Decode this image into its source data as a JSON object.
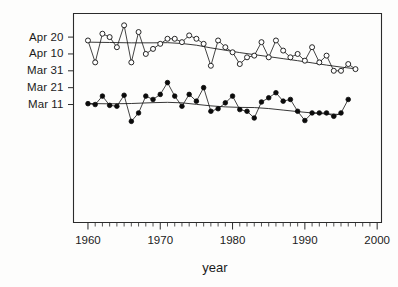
{
  "chart_data": {
    "type": "line",
    "title": "",
    "xlabel": "year",
    "ylabel": "",
    "xlim": [
      1958.0,
      2000.6
    ],
    "ylim": [
      0,
      124
    ],
    "grid": false,
    "legend_position": "none",
    "x_ticks_major": [
      1960,
      1970,
      1980,
      1990,
      2000
    ],
    "x_tick_labels": [
      "1960",
      "1970",
      "1980",
      "1990",
      "2000"
    ],
    "x_ticks_minor_step": 1,
    "y_ticks": [
      110,
      100,
      90,
      80,
      70
    ],
    "y_tick_labels": [
      "Apr 20",
      "Apr 10",
      "Mar 31",
      "Mar 21",
      "Mar 11"
    ],
    "y_axis_note": "day-of-year style calendar dates, 10-day intervals",
    "series": [
      {
        "name": "open-circles-series",
        "marker": "open-circle",
        "x": [
          1960,
          1961,
          1962,
          1963,
          1964,
          1965,
          1966,
          1967,
          1968,
          1969,
          1970,
          1971,
          1972,
          1973,
          1974,
          1975,
          1976,
          1977,
          1978,
          1979,
          1980,
          1981,
          1982,
          1983,
          1984,
          1985,
          1986,
          1987,
          1988,
          1989,
          1990,
          1991,
          1992,
          1993,
          1994,
          1995,
          1996,
          1997
        ],
        "values": [
          108,
          95,
          112,
          110,
          104,
          117,
          95,
          113,
          100,
          103,
          106,
          109,
          109,
          107,
          111,
          109,
          106,
          93,
          108,
          104,
          101,
          94,
          98,
          99,
          107,
          98,
          108,
          102,
          98,
          100,
          96,
          104,
          95,
          99,
          90,
          90,
          94,
          91
        ]
      },
      {
        "name": "filled-circles-series",
        "marker": "filled-circle",
        "x": [
          1960,
          1961,
          1962,
          1963,
          1964,
          1965,
          1966,
          1967,
          1968,
          1969,
          1970,
          1971,
          1972,
          1973,
          1974,
          1975,
          1976,
          1977,
          1978,
          1979,
          1980,
          1981,
          1982,
          1983,
          1984,
          1985,
          1986,
          1987,
          1988,
          1989,
          1990,
          1991,
          1992,
          1993,
          1994,
          1995,
          1996
        ],
        "values": [
          70.5,
          70,
          75,
          69.5,
          69,
          75.5,
          60,
          65,
          75,
          73,
          76,
          83,
          75,
          69,
          76,
          72,
          80,
          66,
          67.5,
          71,
          75,
          67,
          66,
          62,
          71.5,
          74,
          77,
          72,
          73,
          66,
          60.5,
          65,
          65,
          65,
          63,
          65,
          73
        ]
      }
    ],
    "smoothers": [
      {
        "name": "open-circles-smoother",
        "x": [
          1960,
          1963,
          1966,
          1969,
          1971,
          1973,
          1975,
          1977,
          1979,
          1981,
          1983,
          1985,
          1987,
          1989,
          1991,
          1993,
          1995,
          1997
        ],
        "values": [
          107,
          106.8,
          106.6,
          106.6,
          106.7,
          106.2,
          105.2,
          103.6,
          102.2,
          100.8,
          99.6,
          98.4,
          97.2,
          96.0,
          94.7,
          93.4,
          92.2,
          91.2
        ]
      },
      {
        "name": "filled-circles-smoother",
        "x": [
          1960,
          1963,
          1966,
          1969,
          1971,
          1973,
          1975,
          1977,
          1979,
          1981,
          1983,
          1985,
          1987,
          1989,
          1991,
          1993,
          1995
        ],
        "values": [
          70.6,
          70.4,
          70.6,
          71.1,
          71.3,
          71.0,
          70.1,
          69.2,
          68.6,
          68.3,
          68.2,
          67.6,
          66.7,
          65.8,
          65.0,
          64.4,
          64.1
        ]
      }
    ]
  },
  "figure": {
    "axis_title_x": "year"
  }
}
